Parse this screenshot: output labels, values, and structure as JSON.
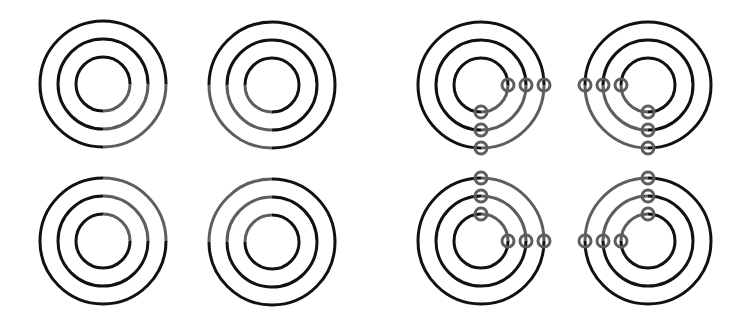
{
  "colors": {
    "background": "#ffffff",
    "ring": "#111111",
    "highlight": "#5e5e5e"
  },
  "rings": {
    "radii": [
      27,
      45,
      63
    ],
    "stroke_width": 3
  },
  "marker_radius": 6,
  "left_group": {
    "label": "plain-targets",
    "targets": [
      {
        "cx": 103,
        "cy": 84,
        "highlight_quadrant": "bottom-right"
      },
      {
        "cx": 272,
        "cy": 85,
        "highlight_quadrant": "bottom-left"
      },
      {
        "cx": 103,
        "cy": 241,
        "highlight_quadrant": "top-right"
      },
      {
        "cx": 272,
        "cy": 242,
        "highlight_quadrant": "top-left"
      }
    ]
  },
  "right_group": {
    "label": "marked-targets",
    "targets": [
      {
        "cx": 481,
        "cy": 85,
        "highlight_quadrant": "bottom-right"
      },
      {
        "cx": 648,
        "cy": 85,
        "highlight_quadrant": "bottom-left"
      },
      {
        "cx": 481,
        "cy": 241,
        "highlight_quadrant": "top-right"
      },
      {
        "cx": 648,
        "cy": 241,
        "highlight_quadrant": "top-left"
      }
    ]
  }
}
